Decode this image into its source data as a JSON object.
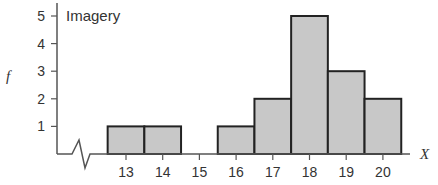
{
  "chart_data": {
    "type": "bar",
    "subtype": "histogram",
    "title": "Imagery",
    "xlabel": "X",
    "ylabel": "f",
    "categories": [
      "13",
      "14",
      "15",
      "16",
      "17",
      "18",
      "19",
      "20"
    ],
    "values": [
      1,
      1,
      0,
      1,
      2,
      5,
      3,
      2
    ],
    "y_ticks": [
      "1",
      "2",
      "3",
      "4",
      "5"
    ],
    "x_ticks": [
      "13",
      "14",
      "15",
      "16",
      "17",
      "18",
      "19",
      "20"
    ],
    "ylim": [
      0,
      5
    ],
    "grid": false,
    "axis_break": true,
    "bar_fill": "#c8c8c8",
    "bar_stroke": "#222222"
  }
}
